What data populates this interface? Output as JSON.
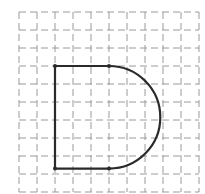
{
  "diagram": {
    "type": "grid-figure",
    "grid": {
      "columns": 10,
      "rows": 10,
      "origin_x": 19,
      "origin_y": 12,
      "cell_size": 18,
      "line_style": "dashed",
      "line_color": "#9a9a9a"
    },
    "shape": {
      "stroke_color": "#2a2a2a",
      "stroke_width": 2.2,
      "left_x_cells": 2,
      "straight_end_x_cells": 5,
      "top_y_cells": 3,
      "bottom_y_cells": 8.7,
      "vertices": [
        {
          "label": "top-left",
          "cx": 2,
          "cy": 3
        },
        {
          "label": "top-right-of-straight",
          "cx": 5,
          "cy": 3
        },
        {
          "label": "bottom-left",
          "cx": 2,
          "cy": 8.7
        },
        {
          "label": "bottom-right-of-straight",
          "cx": 5,
          "cy": 8.7
        }
      ]
    }
  }
}
